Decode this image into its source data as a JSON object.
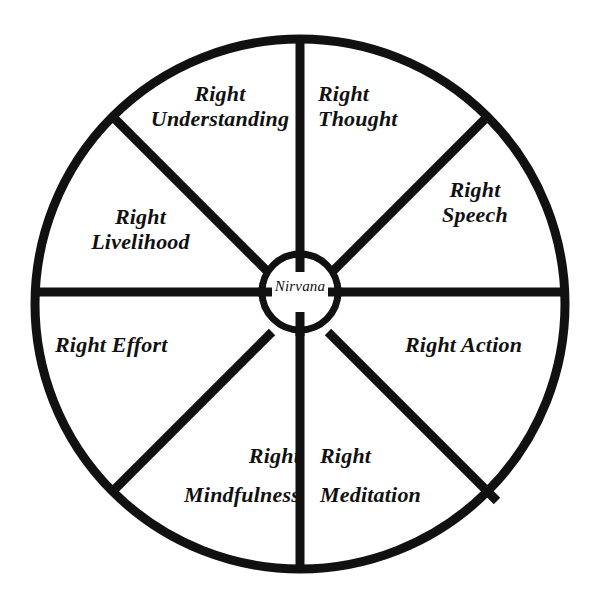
{
  "figure": {
    "type": "radial-diagram",
    "background_color": "#ffffff",
    "stroke_color": "#111111"
  },
  "geometry": {
    "center_x": 300,
    "center_y": 304,
    "outer_radius": 265,
    "hub_radius": 38,
    "rim_stroke": 9,
    "spoke_stroke": 9,
    "hub_stroke": 7,
    "sector_count": 8
  },
  "hub": {
    "label": "Nirvana"
  },
  "sectors": [
    {
      "id": "right-understanding",
      "label": "Right\nUnderstanding",
      "line1": "Right",
      "line2": "Understanding",
      "position": "upper-left"
    },
    {
      "id": "right-thought",
      "label": "Right\nThought",
      "line1": "Right",
      "line2": "Thought",
      "position": "upper-right"
    },
    {
      "id": "right-speech",
      "label": "Right\nSpeech",
      "line1": "Right",
      "line2": "Speech",
      "position": "right-upper"
    },
    {
      "id": "right-action",
      "label": "Right Action",
      "line1": "Right Action",
      "line2": "",
      "position": "right-lower"
    },
    {
      "id": "right-meditation",
      "label": "Right\nMeditation",
      "line1": "Right",
      "line2": "Meditation",
      "position": "lower-right"
    },
    {
      "id": "right-mindfulness",
      "label": "Right\nMindfulness",
      "line1": "Right",
      "line2": "Mindfulness",
      "position": "lower-left"
    },
    {
      "id": "right-effort",
      "label": "Right Effort",
      "line1": "Right Effort",
      "line2": "",
      "position": "left-lower"
    },
    {
      "id": "right-livelihood",
      "label": "Right\nLivelihood",
      "line1": "Right",
      "line2": "Livelihood",
      "position": "left-upper"
    }
  ]
}
